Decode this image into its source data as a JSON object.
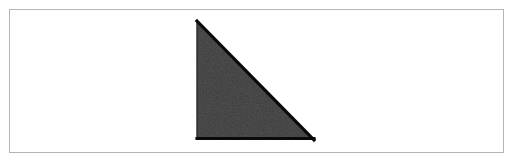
{
  "figure": {
    "canvas": {
      "width": 515,
      "height": 164,
      "background_color": "#ffffff"
    },
    "frame": {
      "name": "figure border",
      "x": 9,
      "y": 9,
      "width": 495,
      "height": 144,
      "stroke_color": "#b5b5b5",
      "stroke_width": 1,
      "fill_color": "#ffffff"
    },
    "shape": {
      "name": "right triangle",
      "type": "polygon",
      "sides": 3,
      "orientation": "right angle at bottom-left",
      "fill_color": "#3a3a3a",
      "stroke_color": "#0a0a0a",
      "stroke_width": 3,
      "vertices": [
        {
          "label": "apex",
          "x": 197,
          "y": 21
        },
        {
          "label": "bottom-left",
          "x": 197,
          "y": 140
        },
        {
          "label": "bottom-right",
          "x": 314,
          "y": 140
        }
      ],
      "points_string": "197,21 197,140 314,140",
      "leg_vertical_length": 119,
      "leg_horizontal_length": 117,
      "bounding_box": {
        "x": 197,
        "y": 21,
        "width": 117,
        "height": 119
      }
    },
    "edges": [
      {
        "name": "hypotenuse",
        "from": "apex",
        "to": "bottom-right",
        "stroke_color": "#0a0a0a",
        "stroke_width": 3
      },
      {
        "name": "bottom-edge",
        "from": "bottom-left",
        "to": "bottom-right",
        "stroke_color": "#0a0a0a",
        "stroke_width": 3
      },
      {
        "name": "left-edge",
        "from": "apex",
        "to": "bottom-left",
        "stroke_color": "#2a2a2a",
        "stroke_width": 1
      }
    ],
    "labels": [],
    "annotations": []
  }
}
